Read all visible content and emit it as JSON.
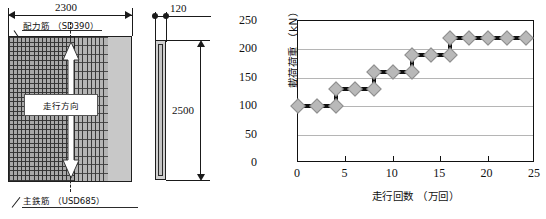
{
  "figure": {
    "left_drawing": {
      "dimensions": [
        {
          "name": "width",
          "value": "2300"
        },
        {
          "name": "thickness",
          "value": "120"
        },
        {
          "name": "length",
          "value": "2500"
        }
      ],
      "callouts": {
        "top_label": "配力筋 （SD390）",
        "bottom_label": "主鉄筋 （USD685）",
        "direction_label": "走行方向"
      }
    },
    "chart_data": {
      "type": "line",
      "title": "",
      "xlabel": "走行回数 （万回）",
      "ylabel": "載荷荷重 （kN）",
      "xlim": [
        0,
        25
      ],
      "ylim": [
        0,
        250
      ],
      "xticks": [
        0,
        5,
        10,
        15,
        20,
        25
      ],
      "yticks": [
        0,
        50,
        100,
        150,
        200,
        250
      ],
      "grid": "horizontal",
      "legend": "none",
      "series": [
        {
          "name": "載荷荷重",
          "x": [
            0,
            2,
            4,
            4,
            6,
            8,
            8,
            10,
            12,
            12,
            14,
            16,
            16,
            18,
            20,
            22,
            24
          ],
          "y": [
            100,
            100,
            100,
            130,
            130,
            130,
            160,
            160,
            160,
            190,
            190,
            190,
            220,
            220,
            220,
            220,
            220
          ]
        }
      ]
    }
  }
}
